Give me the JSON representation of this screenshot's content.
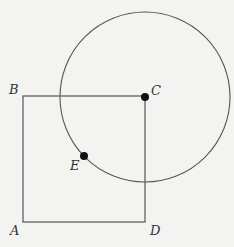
{
  "diagram": {
    "type": "geometry",
    "points": {
      "A": {
        "label": "A",
        "x": 23,
        "y": 222
      },
      "B": {
        "label": "B",
        "x": 23,
        "y": 96
      },
      "C": {
        "label": "C",
        "x": 145,
        "y": 96
      },
      "D": {
        "label": "D",
        "x": 145,
        "y": 222
      },
      "E": {
        "label": "E",
        "x": 84,
        "y": 156
      }
    },
    "circle": {
      "center": "C",
      "radius": 85
    },
    "colors": {
      "line": "#555555",
      "point": "#111111",
      "background": "#f3f3f1"
    }
  }
}
